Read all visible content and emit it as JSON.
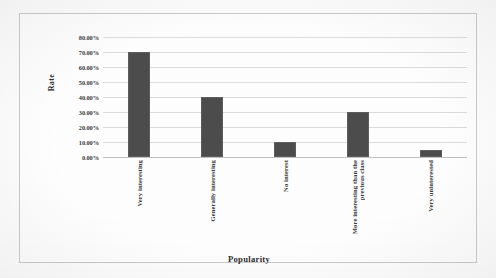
{
  "chart_data": {
    "type": "bar",
    "title": "",
    "xlabel": "Popularity",
    "ylabel": "Rate",
    "categories": [
      "Very interesting",
      "Generally interesting",
      "No interest",
      "More interesting than the previous class",
      "Very uninterested"
    ],
    "category_lines": [
      [
        "Very interesting"
      ],
      [
        "Generally interesting"
      ],
      [
        "No interest"
      ],
      [
        "More interesting than the",
        "previous class"
      ],
      [
        "Very uninterested"
      ]
    ],
    "values": [
      70,
      40,
      10,
      30,
      5
    ],
    "value_labels": [
      "70.00%",
      "40.00%",
      "10.00%",
      "30.00%",
      "5.00%"
    ],
    "ylim": [
      0,
      80
    ],
    "ytick_values": [
      0,
      10,
      20,
      30,
      40,
      50,
      60,
      70,
      80
    ],
    "ytick_labels": [
      "0.00%",
      "10.00%",
      "20.00%",
      "30.00%",
      "40.00%",
      "50.00%",
      "60.00%",
      "70.00%",
      "80.00%"
    ],
    "grid": true,
    "grid_axis": "y",
    "legend": false,
    "legend_position": "none",
    "bar_color": "#4c4c4c",
    "gridline_color": "#dcdcdc",
    "text_color": "#3a3a3a",
    "background_color": "#fefefe"
  }
}
